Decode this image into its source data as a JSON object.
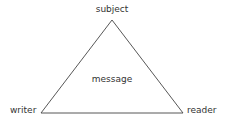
{
  "diagram": {
    "type": "rhetorical-triangle",
    "vertices": {
      "top": {
        "label": "subject"
      },
      "bottom_left": {
        "label": "writer"
      },
      "bottom_right": {
        "label": "reader"
      }
    },
    "center": {
      "label": "message"
    },
    "colors": {
      "line": "#444444",
      "text": "#333333",
      "background": "#ffffff"
    }
  }
}
